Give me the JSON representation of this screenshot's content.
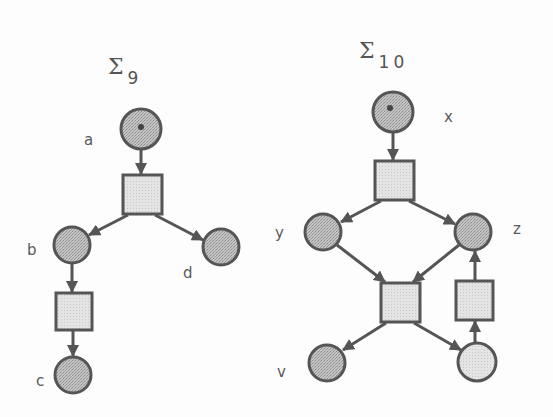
{
  "colors": {
    "background": "#fdfdfd",
    "stroke": "#555555",
    "place_fill": "#b9b9b9",
    "place_fill_light": "#dedede",
    "transition_fill": "#e6e6e6",
    "token": "#444444"
  },
  "nets": [
    {
      "id": "sigma9",
      "title": {
        "symbol": "Σ",
        "subscript": "9"
      },
      "places": [
        {
          "id": "a",
          "label": "a",
          "marked": true
        },
        {
          "id": "b",
          "label": "b",
          "marked": false
        },
        {
          "id": "d",
          "label": "d",
          "marked": false
        },
        {
          "id": "c",
          "label": "c",
          "marked": false
        }
      ],
      "transitions": [
        "t1",
        "t2"
      ],
      "arcs": [
        [
          "a",
          "t1"
        ],
        [
          "t1",
          "b"
        ],
        [
          "t1",
          "d"
        ],
        [
          "b",
          "t2"
        ],
        [
          "t2",
          "c"
        ]
      ]
    },
    {
      "id": "sigma10",
      "title": {
        "symbol": "Σ",
        "subscript": "10"
      },
      "places": [
        {
          "id": "x",
          "label": "x",
          "marked": true
        },
        {
          "id": "y",
          "label": "y",
          "marked": false
        },
        {
          "id": "z",
          "label": "z",
          "marked": false
        },
        {
          "id": "v",
          "label": "v",
          "marked": false
        },
        {
          "id": "w",
          "label": "",
          "marked": false
        }
      ],
      "transitions": [
        "t1",
        "t2",
        "t3"
      ],
      "arcs": [
        [
          "x",
          "t1"
        ],
        [
          "t1",
          "y"
        ],
        [
          "t1",
          "z"
        ],
        [
          "y",
          "t2"
        ],
        [
          "z",
          "t2"
        ],
        [
          "t2",
          "v"
        ],
        [
          "t2",
          "w"
        ],
        [
          "w",
          "t3"
        ],
        [
          "t3",
          "z"
        ]
      ]
    }
  ]
}
